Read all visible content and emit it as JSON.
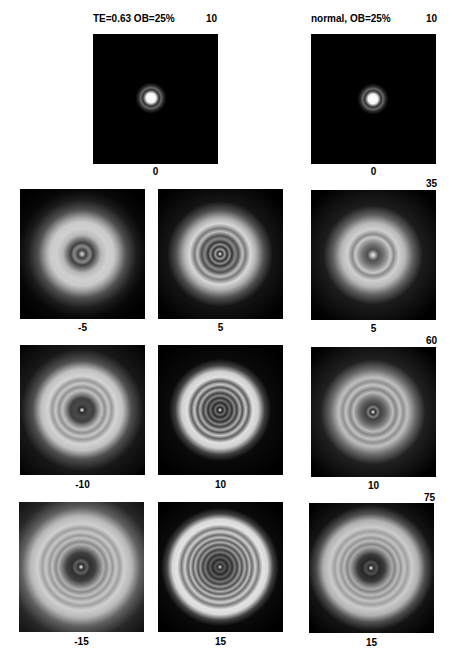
{
  "figure": {
    "left_column_title": "TE=0.63  OB=25%",
    "right_column_title": "normal,  OB=25%",
    "row_labels_right": [
      "10",
      "35",
      "60",
      "75"
    ],
    "top_left_corner_label": "10",
    "panels": [
      {
        "id": "r1c1",
        "below_label": "0",
        "pattern": "airy"
      },
      {
        "id": "r1c3",
        "below_label": "0",
        "pattern": "airy"
      },
      {
        "id": "r2c1",
        "below_label": "-5",
        "pattern": "defocus"
      },
      {
        "id": "r2c2",
        "below_label": "5",
        "pattern": "defocus"
      },
      {
        "id": "r2c3",
        "below_label": "5",
        "pattern": "defocus"
      },
      {
        "id": "r3c1",
        "below_label": "-10",
        "pattern": "defocus"
      },
      {
        "id": "r3c2",
        "below_label": "10",
        "pattern": "defocus"
      },
      {
        "id": "r3c3",
        "below_label": "10",
        "pattern": "defocus"
      },
      {
        "id": "r4c1",
        "below_label": "-15",
        "pattern": "defocus"
      },
      {
        "id": "r4c2",
        "below_label": "15",
        "pattern": "defocus"
      },
      {
        "id": "r4c3",
        "below_label": "15",
        "pattern": "defocus"
      }
    ]
  }
}
